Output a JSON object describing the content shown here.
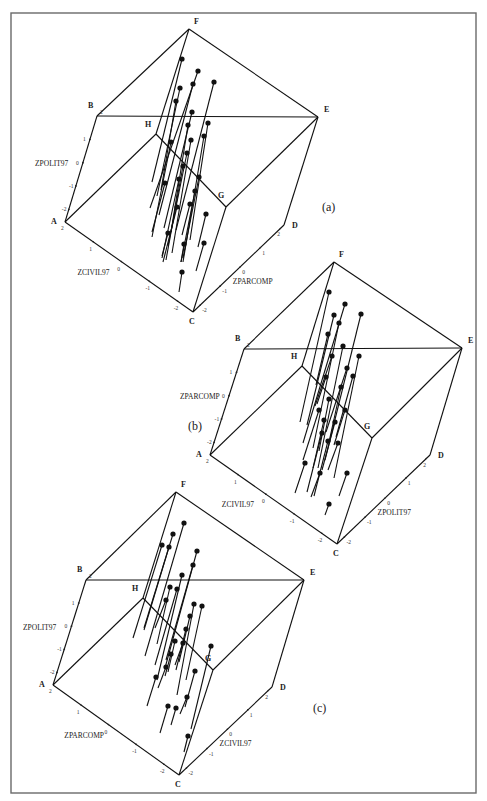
{
  "chart_data": [
    {
      "type": "scatter",
      "panel_label": "(a)",
      "title": "",
      "axes": {
        "vertical": {
          "label": "ZPOLIT97",
          "ticks": [
            "2",
            "1",
            "0",
            "-1",
            "-2"
          ]
        },
        "left_depth": {
          "label": "ZCIVIL97",
          "ticks": [
            "2",
            "1",
            "0",
            "-1",
            "-2"
          ]
        },
        "right_depth": {
          "label": "ZPARCOMP",
          "ticks": [
            "-2",
            "-1",
            "0",
            "1",
            "2"
          ]
        },
        "range": [
          -2,
          2
        ]
      },
      "cube_vertices": {
        "A": [
          65,
          222
        ],
        "B": [
          97,
          116
        ],
        "C": [
          193,
          312
        ],
        "D": [
          284,
          225
        ],
        "E": [
          318,
          117
        ],
        "F": [
          189,
          29
        ],
        "G": [
          226,
          207
        ],
        "H": [
          156,
          134
        ]
      },
      "points_px": [
        [
          182,
          59,
          152,
          182
        ],
        [
          198,
          71,
          150,
          208
        ],
        [
          180,
          88,
          157,
          196
        ],
        [
          193,
          84,
          159,
          215
        ],
        [
          214,
          82,
          176,
          230
        ],
        [
          176,
          101,
          161,
          190
        ],
        [
          192,
          112,
          164,
          228
        ],
        [
          188,
          125,
          171,
          232
        ],
        [
          208,
          123,
          190,
          240
        ],
        [
          191,
          140,
          172,
          253
        ],
        [
          204,
          136,
          183,
          262
        ],
        [
          171,
          142,
          152,
          237
        ],
        [
          187,
          153,
          168,
          246
        ],
        [
          183,
          166,
          166,
          260
        ],
        [
          199,
          177,
          183,
          258
        ],
        [
          179,
          179,
          162,
          258
        ],
        [
          195,
          191,
          181,
          262
        ],
        [
          165,
          183,
          152,
          232
        ],
        [
          190,
          204,
          182,
          235
        ],
        [
          177,
          207,
          163,
          262
        ],
        [
          206,
          214,
          198,
          247
        ],
        [
          168,
          233,
          162,
          256
        ],
        [
          204,
          243,
          196,
          271
        ],
        [
          184,
          244,
          181,
          262
        ],
        [
          182,
          272,
          179,
          292
        ]
      ]
    },
    {
      "type": "scatter",
      "panel_label": "(b)",
      "title": "",
      "axes": {
        "vertical": {
          "label": "ZPARCOMP",
          "ticks": [
            "2",
            "1",
            "0",
            "-1",
            "-2"
          ]
        },
        "left_depth": {
          "label": "ZCIVIL97",
          "ticks": [
            "2",
            "1",
            "0",
            "-1",
            "-2"
          ]
        },
        "right_depth": {
          "label": "ZPOLIT97",
          "ticks": [
            "-2",
            "-1",
            "0",
            "1",
            "2"
          ]
        },
        "range": [
          -2,
          2
        ]
      },
      "cube_vertices": {
        "A": [
          210,
          455
        ],
        "B": [
          244,
          349
        ],
        "C": [
          337,
          544
        ],
        "D": [
          430,
          455
        ],
        "E": [
          462,
          348
        ],
        "F": [
          334,
          262
        ],
        "G": [
          372,
          438
        ],
        "H": [
          302,
          366
        ]
      },
      "points_px": [
        [
          329,
          292,
          300,
          422
        ],
        [
          345,
          304,
          303,
          443
        ],
        [
          334,
          315,
          307,
          425
        ],
        [
          339,
          323,
          313,
          448
        ],
        [
          361,
          314,
          325,
          460
        ],
        [
          328,
          334,
          316,
          385
        ],
        [
          343,
          346,
          318,
          468
        ],
        [
          332,
          356,
          315,
          406
        ],
        [
          359,
          356,
          334,
          478
        ],
        [
          347,
          368,
          326,
          432
        ],
        [
          326,
          377,
          317,
          404
        ],
        [
          353,
          376,
          336,
          437
        ],
        [
          341,
          387,
          329,
          442
        ],
        [
          329,
          399,
          319,
          451
        ],
        [
          319,
          410,
          303,
          460
        ],
        [
          345,
          410,
          334,
          445
        ],
        [
          324,
          420,
          313,
          468
        ],
        [
          335,
          422,
          322,
          470
        ],
        [
          322,
          433,
          307,
          492
        ],
        [
          328,
          441,
          314,
          496
        ],
        [
          338,
          443,
          328,
          470
        ],
        [
          305,
          463,
          295,
          493
        ],
        [
          320,
          473,
          311,
          497
        ],
        [
          347,
          473,
          339,
          496
        ],
        [
          329,
          504,
          325,
          515
        ]
      ]
    },
    {
      "type": "scatter",
      "panel_label": "(c)",
      "title": "",
      "axes": {
        "vertical": {
          "label": "ZPOLIT97",
          "ticks": [
            "2",
            "1",
            "0",
            "-1",
            "-2"
          ]
        },
        "left_depth": {
          "label": "ZPARCOMP",
          "ticks": [
            "2",
            "1",
            "0",
            "-1",
            "-2"
          ]
        },
        "right_depth": {
          "label": "ZCIVIL97",
          "ticks": [
            "-2",
            "-1",
            "0",
            "1",
            "2"
          ]
        },
        "range": [
          -2,
          2
        ]
      },
      "cube_vertices": {
        "A": [
          53,
          685
        ],
        "B": [
          86,
          580
        ],
        "C": [
          179,
          775
        ],
        "D": [
          272,
          687
        ],
        "E": [
          304,
          580
        ],
        "F": [
          176,
          492
        ],
        "G": [
          213,
          670
        ],
        "H": [
          143,
          598
        ]
      },
      "points_px": [
        [
          184,
          523,
          145,
          656
        ],
        [
          173,
          534,
          144,
          628
        ],
        [
          162,
          545,
          133,
          638
        ],
        [
          169,
          547,
          144,
          630
        ],
        [
          197,
          551,
          165,
          668
        ],
        [
          193,
          565,
          166,
          660
        ],
        [
          182,
          575,
          157,
          680
        ],
        [
          170,
          587,
          157,
          644
        ],
        [
          177,
          589,
          155,
          665
        ],
        [
          166,
          600,
          155,
          628
        ],
        [
          194,
          604,
          177,
          695
        ],
        [
          202,
          606,
          186,
          680
        ],
        [
          190,
          616,
          179,
          662
        ],
        [
          186,
          629,
          176,
          670
        ],
        [
          175,
          641,
          168,
          672
        ],
        [
          183,
          643,
          175,
          665
        ],
        [
          211,
          646,
          191,
          729
        ],
        [
          171,
          654,
          165,
          676
        ],
        [
          166,
          667,
          158,
          688
        ],
        [
          195,
          671,
          185,
          707
        ],
        [
          156,
          677,
          147,
          706
        ],
        [
          187,
          697,
          180,
          714
        ],
        [
          168,
          706,
          160,
          733
        ],
        [
          176,
          708,
          171,
          725
        ],
        [
          188,
          736,
          184,
          752
        ]
      ]
    }
  ],
  "figure": {
    "panel_labels": [
      "(a)",
      "(b)",
      "(c)"
    ],
    "vertex_letters": [
      "A",
      "B",
      "C",
      "D",
      "E",
      "F",
      "G",
      "H"
    ]
  }
}
